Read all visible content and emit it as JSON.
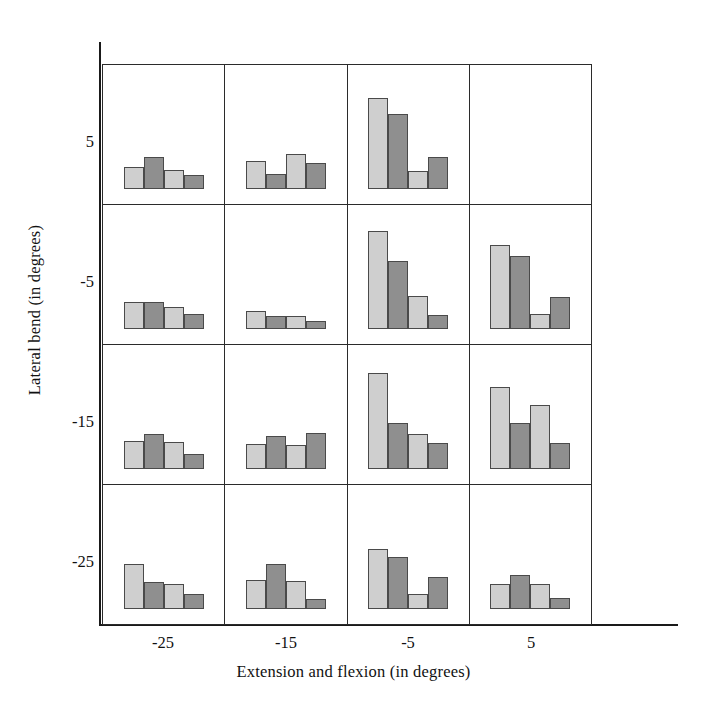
{
  "chart_data": {
    "type": "bar",
    "title": "",
    "xlabel": "Extension and flexion (in degrees)",
    "ylabel": "Lateral bend (in degrees)",
    "xtick_labels": [
      "-25",
      "-15",
      "-5",
      "5"
    ],
    "ytick_labels": [
      "5",
      "-5",
      "-15",
      "-25"
    ],
    "x_categories": [
      -25,
      -15,
      -5,
      5
    ],
    "y_categories": [
      5,
      -5,
      -15,
      -25
    ],
    "grid": true,
    "legend": "none",
    "bars_per_panel": 4,
    "bar_colors": [
      "#cfcfcf",
      "#8f8f8f",
      "#cfcfcf",
      "#8f8f8f"
    ],
    "bar_shades": [
      "light",
      "dark",
      "light",
      "dark"
    ],
    "ylim": [
      0,
      100
    ],
    "panels": [
      {
        "row_label": "5",
        "col_label": "-25",
        "lateral_bend": 5,
        "extension_flexion": -25,
        "values": [
          19,
          27,
          16,
          12
        ]
      },
      {
        "row_label": "5",
        "col_label": "-15",
        "lateral_bend": 5,
        "extension_flexion": -15,
        "values": [
          24,
          13,
          30,
          22
        ]
      },
      {
        "row_label": "5",
        "col_label": "-5",
        "lateral_bend": 5,
        "extension_flexion": -5,
        "values": [
          78,
          64,
          15,
          27
        ]
      },
      {
        "row_label": "5",
        "col_label": "5",
        "lateral_bend": 5,
        "extension_flexion": 5,
        "values": [
          0,
          0,
          0,
          0
        ]
      },
      {
        "row_label": "-5",
        "col_label": "-25",
        "lateral_bend": -5,
        "extension_flexion": -25,
        "values": [
          23,
          23,
          19,
          13
        ]
      },
      {
        "row_label": "-5",
        "col_label": "-15",
        "lateral_bend": -5,
        "extension_flexion": -15,
        "values": [
          15,
          11,
          11,
          7
        ]
      },
      {
        "row_label": "-5",
        "col_label": "-5",
        "lateral_bend": -5,
        "extension_flexion": -5,
        "values": [
          84,
          58,
          28,
          12
        ]
      },
      {
        "row_label": "-5",
        "col_label": "5",
        "lateral_bend": -5,
        "extension_flexion": 5,
        "values": [
          72,
          62,
          13,
          27
        ]
      },
      {
        "row_label": "-15",
        "col_label": "-25",
        "lateral_bend": -15,
        "extension_flexion": -25,
        "values": [
          24,
          30,
          23,
          13
        ]
      },
      {
        "row_label": "-15",
        "col_label": "-15",
        "lateral_bend": -15,
        "extension_flexion": -15,
        "values": [
          21,
          28,
          20,
          31
        ]
      },
      {
        "row_label": "-15",
        "col_label": "-5",
        "lateral_bend": -15,
        "extension_flexion": -5,
        "values": [
          82,
          39,
          30,
          22
        ]
      },
      {
        "row_label": "-15",
        "col_label": "5",
        "lateral_bend": -15,
        "extension_flexion": 5,
        "values": [
          70,
          39,
          55,
          22
        ]
      },
      {
        "row_label": "-25",
        "col_label": "-25",
        "lateral_bend": -25,
        "extension_flexion": -25,
        "values": [
          38,
          23,
          21,
          13
        ]
      },
      {
        "row_label": "-25",
        "col_label": "-15",
        "lateral_bend": -25,
        "extension_flexion": -15,
        "values": [
          25,
          38,
          24,
          8
        ]
      },
      {
        "row_label": "-25",
        "col_label": "-5",
        "lateral_bend": -25,
        "extension_flexion": -5,
        "values": [
          51,
          44,
          13,
          27
        ]
      },
      {
        "row_label": "-25",
        "col_label": "5",
        "lateral_bend": -25,
        "extension_flexion": 5,
        "values": [
          21,
          29,
          21,
          9
        ]
      }
    ]
  },
  "axes": {
    "x_label": "Extension and flexion (in degrees)",
    "y_label": "Lateral bend (in degrees)",
    "x_ticks": [
      "-25",
      "-15",
      "-5",
      "5"
    ],
    "y_ticks": [
      "5",
      "-5",
      "-15",
      "-25"
    ]
  },
  "colors": {
    "light_bar": "#cfcfcf",
    "dark_bar": "#8f8f8f",
    "bar_outline": "#4a4a4a",
    "panel_border": "#2b2b2b",
    "axis": "#1a1a1a",
    "background": "#ffffff"
  }
}
